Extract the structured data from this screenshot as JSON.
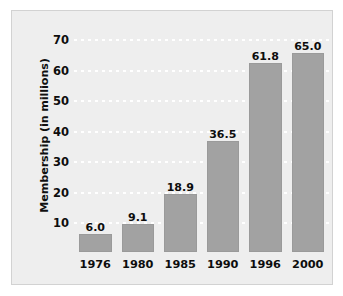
{
  "chart_data": {
    "type": "bar",
    "title": "",
    "subtitle": "",
    "xlabel": "",
    "ylabel": "Membership (in millions)",
    "categories": [
      "1976",
      "1980",
      "1985",
      "1990",
      "1996",
      "2000"
    ],
    "values": [
      6.0,
      9.1,
      18.9,
      36.5,
      61.8,
      65.0
    ],
    "value_labels": [
      "6.0",
      "9.1",
      "18.9",
      "36.5",
      "61.8",
      "65.0"
    ],
    "series": [
      {
        "name": "Membership",
        "values": [
          6.0,
          9.1,
          18.9,
          36.5,
          61.8,
          65.0
        ]
      }
    ],
    "ylim": [
      0,
      73
    ],
    "y_ticks": [
      70,
      60,
      50,
      40,
      30,
      20,
      10
    ],
    "y_tick_labels": [
      "70",
      "60",
      "50",
      "40",
      "30",
      "20",
      "10"
    ],
    "grid": "horizontal-dotted-white",
    "legend": "none",
    "colors": {
      "bar_fill": "#a2a2a2",
      "bar_border": "#9a9a9a",
      "panel_background": "#eeeeee",
      "panel_border": "#d2d2d2",
      "page_background": "#ffffff",
      "gridline": "#ffffff",
      "text": "#0d0d0d"
    }
  }
}
